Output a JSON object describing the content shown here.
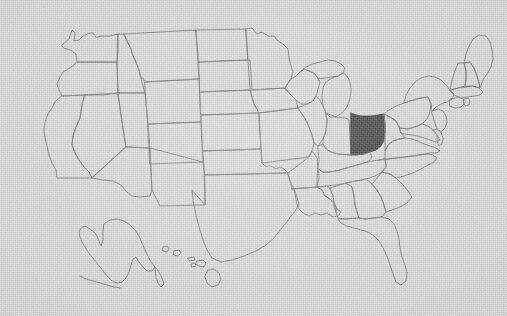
{
  "figure": {
    "kind": "us-state-locator-map",
    "title": "Map of the United States with Ohio highlighted",
    "width": 507,
    "height": 316,
    "background_color": "#d5d5d5",
    "border_color": "#6d6d6d",
    "highlight_color": "#333333",
    "state_fill_color": "none",
    "texture": "paper-grain-noise",
    "projection": "albers-usa",
    "labels_visible": false,
    "legend_visible": false,
    "title_visible": false
  },
  "highlighted": {
    "name": "Ohio",
    "abbr": "OH",
    "fill": "#333333",
    "bbox_px": [
      351,
      113,
      384,
      155
    ]
  },
  "insets": [
    {
      "name": "Alaska",
      "abbr": "AK",
      "position": "lower-left",
      "bbox_px": [
        74,
        218,
        166,
        300
      ]
    },
    {
      "name": "Hawaii",
      "abbr": "HI",
      "position": "lower-left-center",
      "bbox_px": [
        155,
        243,
        226,
        290
      ]
    }
  ],
  "regions": {
    "contiguous": "48 contiguous states drawn as outlines",
    "count_states_drawn": 50
  },
  "chart_data": {
    "type": "map",
    "value_field": "highlighted",
    "categories": [
      "Alabama",
      "Alaska",
      "Arizona",
      "Arkansas",
      "California",
      "Colorado",
      "Connecticut",
      "Delaware",
      "Florida",
      "Georgia",
      "Hawaii",
      "Idaho",
      "Illinois",
      "Indiana",
      "Iowa",
      "Kansas",
      "Kentucky",
      "Louisiana",
      "Maine",
      "Maryland",
      "Massachusetts",
      "Michigan",
      "Minnesota",
      "Mississippi",
      "Missouri",
      "Montana",
      "Nebraska",
      "Nevada",
      "New Hampshire",
      "New Jersey",
      "New Mexico",
      "New York",
      "North Carolina",
      "North Dakota",
      "Ohio",
      "Oklahoma",
      "Oregon",
      "Pennsylvania",
      "Rhode Island",
      "South Carolina",
      "South Dakota",
      "Tennessee",
      "Texas",
      "Utah",
      "Vermont",
      "Virginia",
      "Washington",
      "West Virginia",
      "Wisconsin",
      "Wyoming"
    ],
    "values": [
      0,
      0,
      0,
      0,
      0,
      0,
      0,
      0,
      0,
      0,
      0,
      0,
      0,
      0,
      0,
      0,
      0,
      0,
      0,
      0,
      0,
      0,
      0,
      0,
      0,
      0,
      0,
      0,
      0,
      0,
      0,
      0,
      0,
      0,
      1,
      0,
      0,
      0,
      0,
      0,
      0,
      0,
      0,
      0,
      0,
      0,
      0,
      0,
      0,
      0
    ],
    "legend": [
      {
        "label": "Highlighted",
        "color": "#333333",
        "value": 1
      },
      {
        "label": "Other states",
        "color": "#d5d5d5",
        "value": 0
      }
    ],
    "xlabel": "",
    "ylabel": ""
  }
}
